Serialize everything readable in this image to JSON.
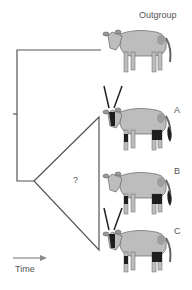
{
  "tree": {
    "unknown_label": "?",
    "line_color": "#555555"
  },
  "taxa": [
    {
      "label": "Outgroup",
      "horns": false,
      "face_mask": false,
      "black_legs": false,
      "black_tail": false
    },
    {
      "label": "A",
      "horns": true,
      "face_mask": true,
      "black_legs": true,
      "black_tail": true
    },
    {
      "label": "B",
      "horns": false,
      "face_mask": false,
      "black_legs": true,
      "black_tail": true
    },
    {
      "label": "C",
      "horns": true,
      "face_mask": true,
      "black_legs": true,
      "black_tail": false
    }
  ],
  "axis": {
    "label": "Time",
    "arrow_color": "#8a8a8a"
  },
  "colors": {
    "body": "#bdbdbd",
    "outline": "#555555",
    "marking": "#1e1e1e"
  }
}
